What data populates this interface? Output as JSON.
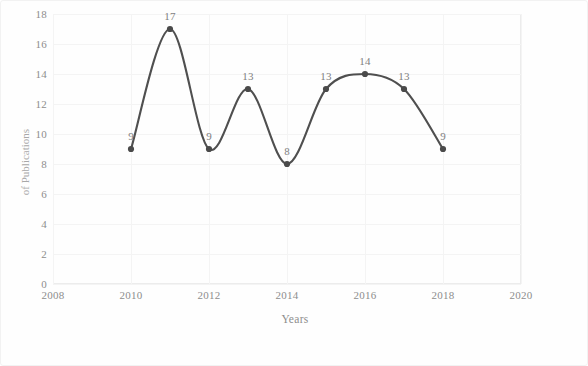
{
  "chart_data": {
    "type": "line",
    "title": "",
    "xlabel": "Years",
    "ylabel": "of Publications",
    "x": [
      2010,
      2011,
      2012,
      2013,
      2014,
      2015,
      2016,
      2017,
      2018
    ],
    "values": [
      9,
      17,
      9,
      13,
      8,
      13,
      14,
      13,
      9
    ],
    "series": [
      {
        "name": "Publications",
        "values": [
          9,
          17,
          9,
          13,
          8,
          13,
          14,
          13,
          9
        ]
      }
    ],
    "data_labels": [
      "9",
      "17",
      "9",
      "13",
      "8",
      "13",
      "14",
      "13",
      "9"
    ],
    "xlim": [
      2008,
      2020
    ],
    "ylim": [
      0,
      18
    ],
    "xticks": [
      "2008",
      "2010",
      "2012",
      "2014",
      "2016",
      "2018",
      "2020"
    ],
    "xtick_values": [
      2008,
      2010,
      2012,
      2014,
      2016,
      2018,
      2020
    ],
    "yticks": [
      "0",
      "2",
      "4",
      "6",
      "8",
      "10",
      "12",
      "14",
      "16",
      "18"
    ],
    "ytick_values": [
      0,
      2,
      4,
      6,
      8,
      10,
      12,
      14,
      16,
      18
    ],
    "grid": true,
    "legend": "none",
    "smooth": true,
    "line_color": "#4f4f4f",
    "marker_color": "#4a4a4a",
    "grid_color": "#f4f4f4",
    "axis_text_color": "#8d8d8d",
    "label_text_color": "#7f7f7f",
    "background_color": "#fefefe"
  }
}
